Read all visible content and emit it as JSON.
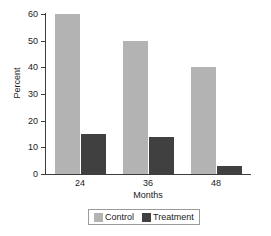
{
  "chart_data": {
    "type": "bar",
    "title": "",
    "subtitle": "",
    "xlabel": "Months",
    "ylabel": "Percent",
    "categories": [
      "24",
      "36",
      "48"
    ],
    "series": [
      {
        "name": "Control",
        "values": [
          60,
          50,
          40
        ],
        "color": "#b3b3b3"
      },
      {
        "name": "Treatment",
        "values": [
          15,
          14,
          3
        ],
        "color": "#404040"
      }
    ],
    "ylim": [
      0,
      60
    ],
    "yticks": [
      0,
      10,
      20,
      30,
      40,
      50,
      60
    ],
    "ytick_labels": [
      "0",
      "10",
      "20",
      "30",
      "40",
      "50",
      "60"
    ],
    "grid": false,
    "legend_position": "bottom-center",
    "legend_entries": [
      "Control",
      "Treatment"
    ],
    "background_color": "#ffffff",
    "axis_color": "#3d3d3d"
  }
}
